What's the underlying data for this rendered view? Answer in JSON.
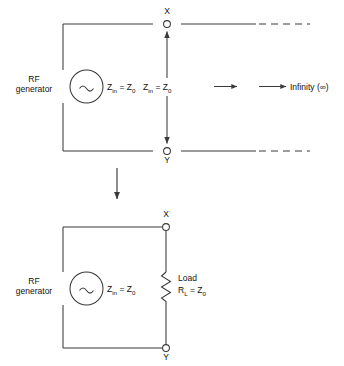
{
  "figure": {
    "type": "circuit-diagram",
    "background": "#ffffff",
    "line_color": "#3a3a3a",
    "text_color": "#111111"
  },
  "top_circuit": {
    "name": "infinite-line-circuit",
    "source_label_line1": "RF",
    "source_label_line2": "generator",
    "source_icon": "sine-wave-ac-source",
    "source_impedance": "Z",
    "source_impedance_sub": "in",
    "source_impedance_eq": " = Z",
    "source_impedance_eq_sub": "0",
    "line_impedance": "Z",
    "line_impedance_sub": "in",
    "line_impedance_eq": " = Z",
    "line_impedance_eq_sub": "0",
    "terminal_top": "X",
    "terminal_bottom": "Y",
    "infinity_label": "Infinity (∞)",
    "line_termination": "dashed-open-ended"
  },
  "transition": {
    "name": "equivalence-arrow",
    "direction": "down"
  },
  "bottom_circuit": {
    "name": "matched-load-circuit",
    "source_label_line1": "RF",
    "source_label_line2": "generator",
    "source_icon": "sine-wave-ac-source",
    "source_impedance": "Z",
    "source_impedance_sub": "in",
    "source_impedance_eq": " = Z",
    "source_impedance_eq_sub": "0",
    "load_label": "Load",
    "load_value": "R",
    "load_value_sub": "L",
    "load_value_eq": " = Z",
    "load_value_eq_sub": "0",
    "load_icon": "zigzag-resistor",
    "terminal_top": "X",
    "terminal_bottom": "Y"
  }
}
